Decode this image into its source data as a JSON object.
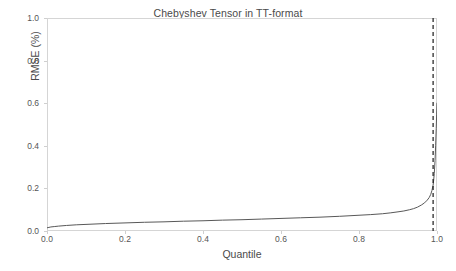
{
  "chart_data": {
    "type": "line",
    "title": "Chebyshev Tensor in TT-format",
    "xlabel": "Quantile",
    "ylabel": "RMSE (%)",
    "xlim": [
      0.0,
      1.0
    ],
    "ylim": [
      0.0,
      1.0
    ],
    "xticks": [
      "0.0",
      "0.2",
      "0.4",
      "0.6",
      "0.8",
      "1.0"
    ],
    "xtick_values": [
      0.0,
      0.2,
      0.4,
      0.6,
      0.8,
      1.0
    ],
    "yticks": [
      "0.0",
      "0.2",
      "0.4",
      "0.6",
      "0.8",
      "1.0"
    ],
    "ytick_values": [
      0.0,
      0.2,
      0.4,
      0.6,
      0.8,
      1.0
    ],
    "grid": false,
    "legend": false,
    "line_color": "#585858",
    "series": [
      {
        "name": "RMSE quantile curve",
        "color": "#585858",
        "x": [
          0.0,
          0.005,
          0.01,
          0.02,
          0.03,
          0.05,
          0.075,
          0.1,
          0.15,
          0.2,
          0.25,
          0.3,
          0.35,
          0.4,
          0.45,
          0.5,
          0.55,
          0.6,
          0.65,
          0.7,
          0.75,
          0.8,
          0.83,
          0.86,
          0.88,
          0.9,
          0.915,
          0.93,
          0.94,
          0.95,
          0.96,
          0.968,
          0.975,
          0.98,
          0.984,
          0.987,
          0.99,
          0.9915,
          0.993,
          0.995,
          0.9965,
          0.998,
          0.999,
          1.0
        ],
        "y": [
          0.015,
          0.017,
          0.019,
          0.021,
          0.023,
          0.026,
          0.029,
          0.031,
          0.035,
          0.038,
          0.041,
          0.043,
          0.046,
          0.048,
          0.051,
          0.053,
          0.056,
          0.059,
          0.062,
          0.065,
          0.069,
          0.074,
          0.077,
          0.081,
          0.085,
          0.09,
          0.094,
          0.1,
          0.105,
          0.112,
          0.122,
          0.132,
          0.145,
          0.157,
          0.172,
          0.19,
          0.215,
          0.24,
          0.27,
          0.33,
          0.4,
          0.48,
          0.545,
          0.6
        ]
      }
    ],
    "annotations": [
      {
        "name": "quantile-threshold-line",
        "type": "vline",
        "x": 0.99,
        "style": "dashed",
        "color": "#1a1a1a"
      }
    ]
  }
}
